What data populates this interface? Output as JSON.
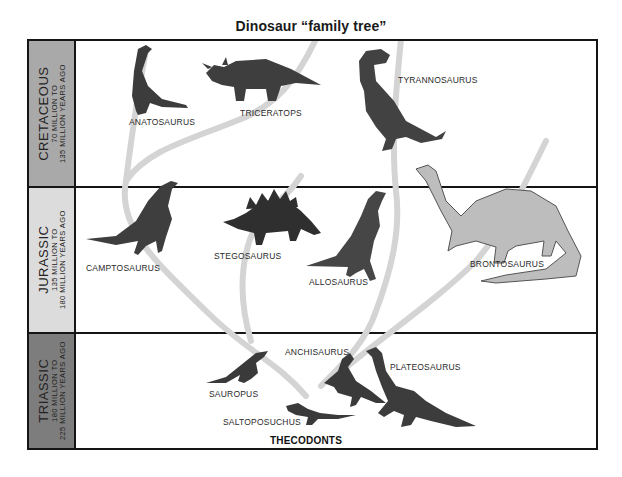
{
  "title": "Dinosaur “family tree”",
  "colors": {
    "frame": "#151515",
    "cretaceous_band": "#a9a9a9",
    "jurassic_band": "#dcdcdc",
    "triassic_band": "#7d7d7d",
    "branch": "#d2d2d2",
    "dino_dark": "#3c3c3c",
    "dino_light": "#9a9a9a"
  },
  "periods": [
    {
      "name": "CRETACEOUS",
      "line1": "70 MILLION TO",
      "line2": "135 MILLION YEARS AGO"
    },
    {
      "name": "JURASSIC",
      "line1": "135 MILLION TO",
      "line2": "180 MILLION YEARS AGO"
    },
    {
      "name": "TRIASSIC",
      "line1": "180 MILLION TO",
      "line2": "225 MILLION YEARS AGO"
    }
  ],
  "dinosaurs": {
    "cretaceous": [
      "ANATOSAURUS",
      "TRICERATOPS",
      "TYRANNOSAURUS"
    ],
    "jurassic": [
      "CAMPTOSAURUS",
      "STEGOSAURUS",
      "ALLOSAURUS",
      "BRONTOSAURUS"
    ],
    "triassic": [
      "SAUROPUS",
      "ANCHISAURUS",
      "PLATEOSAURUS",
      "SALTOPOSUCHUS"
    ]
  },
  "root_label": "THECODONTS"
}
